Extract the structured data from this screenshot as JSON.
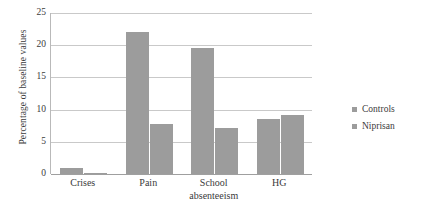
{
  "chart_data": {
    "type": "bar",
    "title": "",
    "xlabel": "",
    "ylabel": "Percentage of baseline values",
    "categories": [
      "Crises",
      "Pain",
      "School absenteeism",
      "HG"
    ],
    "category_lines": [
      [
        "Crises"
      ],
      [
        "Pain"
      ],
      [
        "School",
        "absenteeism"
      ],
      [
        "HG"
      ]
    ],
    "series": [
      {
        "name": "Controls",
        "values": [
          1.0,
          22.0,
          19.6,
          8.6
        ],
        "color": "#9c9c9c"
      },
      {
        "name": "Niprisan",
        "values": [
          0.2,
          7.8,
          7.1,
          9.2
        ],
        "color": "#9c9c9c"
      }
    ],
    "ylim": [
      0,
      25
    ],
    "yticks": [
      0,
      5,
      10,
      15,
      20,
      25
    ],
    "ytick_labels": [
      "0",
      "5",
      "10",
      "15",
      "20",
      "25"
    ],
    "grid": true,
    "legend_position": "right",
    "legend_entries": [
      "Controls",
      "Niprisan"
    ]
  },
  "colors": {
    "bar": "#9c9c9c",
    "gridline": "#c9c9c9",
    "axis": "#9f9f9f",
    "text": "#3b3b3b",
    "background": "#ffffff"
  }
}
